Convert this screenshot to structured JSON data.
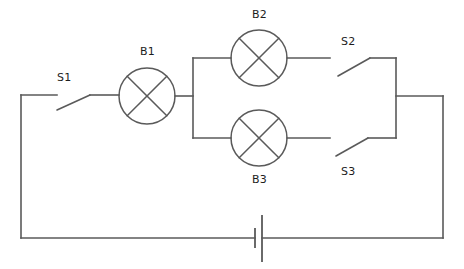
{
  "diagram": {
    "type": "electrical-circuit-schematic",
    "background_color": "#ffffff",
    "line_color": "#5a5a5a",
    "text_color": "#1d1d1d",
    "canvas": {
      "width": 464,
      "height": 269
    }
  },
  "labels": {
    "s1": "S1",
    "b1": "B1",
    "b2": "B2",
    "b3": "B3",
    "s2": "S2",
    "s3": "S3"
  },
  "components": [
    {
      "id": "s1",
      "name": "S1",
      "kind": "switch",
      "state": "open",
      "label_x": 67,
      "label_y": 72,
      "hinge_x": 57,
      "hinge_y": 110,
      "contact_x": 90,
      "contact_y": 95
    },
    {
      "id": "b1",
      "name": "B1",
      "kind": "lamp",
      "cx": 147,
      "cy": 96,
      "r": 28,
      "label_x": 147,
      "label_y": 46
    },
    {
      "id": "b2",
      "name": "B2",
      "kind": "lamp",
      "cx": 259,
      "cy": 58,
      "r": 28,
      "label_x": 259,
      "label_y": 9
    },
    {
      "id": "b3",
      "name": "B3",
      "kind": "lamp",
      "cx": 259,
      "cy": 138,
      "r": 28,
      "label_x": 259,
      "label_y": 174
    },
    {
      "id": "s2",
      "name": "S2",
      "kind": "switch",
      "state": "open",
      "label_x": 348,
      "label_y": 36,
      "hinge_x": 338,
      "hinge_y": 76,
      "contact_x": 370,
      "contact_y": 58
    },
    {
      "id": "s3",
      "name": "S3",
      "kind": "switch",
      "state": "open",
      "label_x": 348,
      "label_y": 166,
      "hinge_x": 336,
      "hinge_y": 156,
      "contact_x": 368,
      "contact_y": 138
    },
    {
      "id": "battery",
      "name": "Battery",
      "kind": "cell",
      "negative_plate_x": 255,
      "positive_plate_x": 262,
      "center_y": 238
    }
  ],
  "geometry": {
    "outer_left_x": 21,
    "outer_right_x": 443,
    "top_rail_y": 95,
    "bottom_rail_y": 238,
    "branch_left_x": 193,
    "branch_right_x": 396,
    "branch_top_y": 58,
    "branch_bottom_y": 138
  }
}
